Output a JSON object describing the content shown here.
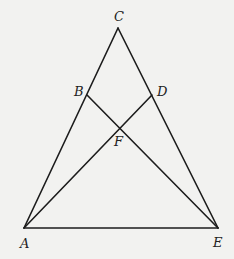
{
  "diagram": {
    "type": "geometry-figure",
    "background": "#f2f2f0",
    "line_color": "#1c1c1c",
    "points": {
      "A": {
        "label": "A",
        "x": 24,
        "y": 228,
        "lx": 20,
        "ly": 248
      },
      "B": {
        "label": "B",
        "x": 87,
        "y": 95,
        "lx": 74,
        "ly": 96
      },
      "C": {
        "label": "C",
        "x": 118,
        "y": 28,
        "lx": 114,
        "ly": 21
      },
      "D": {
        "label": "D",
        "x": 152,
        "y": 95,
        "lx": 157,
        "ly": 96
      },
      "E": {
        "label": "E",
        "x": 218,
        "y": 228,
        "lx": 213,
        "ly": 247
      },
      "F": {
        "label": "F",
        "x": 120,
        "y": 128,
        "lx": 114,
        "ly": 146
      }
    },
    "segments": [
      {
        "from": "A",
        "to": "C"
      },
      {
        "from": "C",
        "to": "E"
      },
      {
        "from": "A",
        "to": "E"
      },
      {
        "from": "A",
        "to": "D"
      },
      {
        "from": "B",
        "to": "E"
      }
    ]
  }
}
